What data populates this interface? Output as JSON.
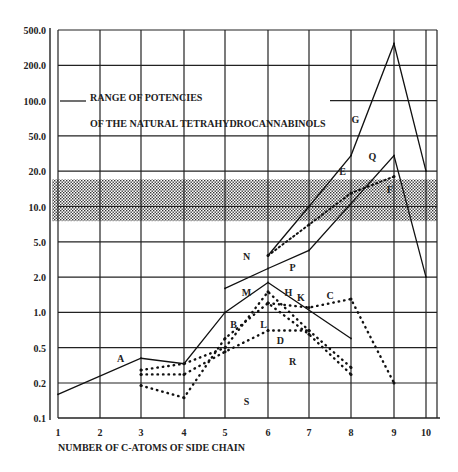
{
  "chart_data": {
    "type": "line",
    "title": "",
    "xlabel": "NUMBER OF C-ATOMS OF SIDE CHAIN",
    "ylabel": "",
    "y_scale": "log (evenly spaced labels)",
    "y_ticks": [
      500.0,
      200.0,
      100.0,
      50.0,
      20.0,
      10.0,
      5.0,
      2.0,
      1.0,
      0.5,
      0.2,
      0.1
    ],
    "y_tick_labels": [
      "500.0",
      "200.0",
      "100.0",
      "50.0",
      "20.0",
      "10.0",
      "5.0",
      "2.0",
      "1.0",
      "0.5",
      "0.2",
      "0.1"
    ],
    "x_ticks": [
      1,
      2,
      3,
      4,
      5,
      6,
      7,
      8,
      9,
      10
    ],
    "x_tick_labels": [
      "1",
      "2",
      "3",
      "4",
      "5",
      "6",
      "7",
      "8",
      "9",
      "10"
    ],
    "xlim": [
      1,
      10
    ],
    "ylim": [
      0.1,
      500
    ],
    "grid": true,
    "annotation": {
      "line1": "RANGE OF POTENCIES",
      "line2": "OF THE NATURAL TETRAHYDROCANNABINOLS",
      "band_range": [
        7.5,
        17
      ]
    },
    "series": [
      {
        "name": "A",
        "style": "solid",
        "x": [
          1,
          3,
          4,
          5,
          6,
          8
        ],
        "y": [
          0.16,
          0.38,
          0.33,
          1.0,
          1.8,
          0.6
        ]
      },
      {
        "name": "P",
        "style": "solid",
        "x": [
          5,
          6,
          7,
          9,
          10
        ],
        "y": [
          1.6,
          2.5,
          4.0,
          30,
          2.0
        ]
      },
      {
        "name": "G",
        "style": "solid",
        "x": [
          6,
          7,
          8,
          9,
          10
        ],
        "y": [
          3.5,
          10,
          30,
          350,
          20
        ]
      },
      {
        "name": "F",
        "style": "dotted-fine",
        "x": [
          6,
          7,
          8,
          9
        ],
        "y": [
          3.5,
          7.0,
          13,
          18
        ]
      },
      {
        "name": "B",
        "style": "dotted",
        "x": [
          3,
          4,
          5,
          6,
          7,
          8
        ],
        "y": [
          0.28,
          0.33,
          0.5,
          1.5,
          0.7,
          0.3
        ]
      },
      {
        "name": "D",
        "style": "dotted",
        "x": [
          3,
          4,
          5,
          6,
          7
        ],
        "y": [
          0.25,
          0.25,
          0.45,
          0.7,
          0.7
        ]
      },
      {
        "name": "R",
        "style": "dotted",
        "x": [
          3,
          4,
          5,
          6,
          7,
          8
        ],
        "y": [
          0.19,
          0.15,
          0.6,
          1.2,
          0.65,
          0.25
        ]
      },
      {
        "name": "C",
        "style": "dotted",
        "x": [
          6,
          7,
          8,
          9
        ],
        "y": [
          1.2,
          1.1,
          1.3,
          0.2
        ]
      }
    ],
    "series_labels": [
      {
        "text": "A",
        "x": 2.5,
        "y": 0.38
      },
      {
        "text": "B",
        "x": 5.2,
        "y": 0.8
      },
      {
        "text": "C",
        "x": 7.5,
        "y": 1.4
      },
      {
        "text": "D",
        "x": 6.3,
        "y": 0.58
      },
      {
        "text": "E",
        "x": 7.8,
        "y": 20
      },
      {
        "text": "F",
        "x": 8.9,
        "y": 14
      },
      {
        "text": "G",
        "x": 8.1,
        "y": 70
      },
      {
        "text": "H",
        "x": 6.5,
        "y": 1.5
      },
      {
        "text": "K",
        "x": 6.8,
        "y": 1.35
      },
      {
        "text": "L",
        "x": 5.9,
        "y": 0.8
      },
      {
        "text": "M",
        "x": 5.5,
        "y": 1.5
      },
      {
        "text": "N",
        "x": 5.5,
        "y": 3.5
      },
      {
        "text": "P",
        "x": 6.6,
        "y": 2.6
      },
      {
        "text": "Q",
        "x": 8.5,
        "y": 30
      },
      {
        "text": "R",
        "x": 6.6,
        "y": 0.35
      },
      {
        "text": "S",
        "x": 5.5,
        "y": 0.14
      }
    ]
  }
}
